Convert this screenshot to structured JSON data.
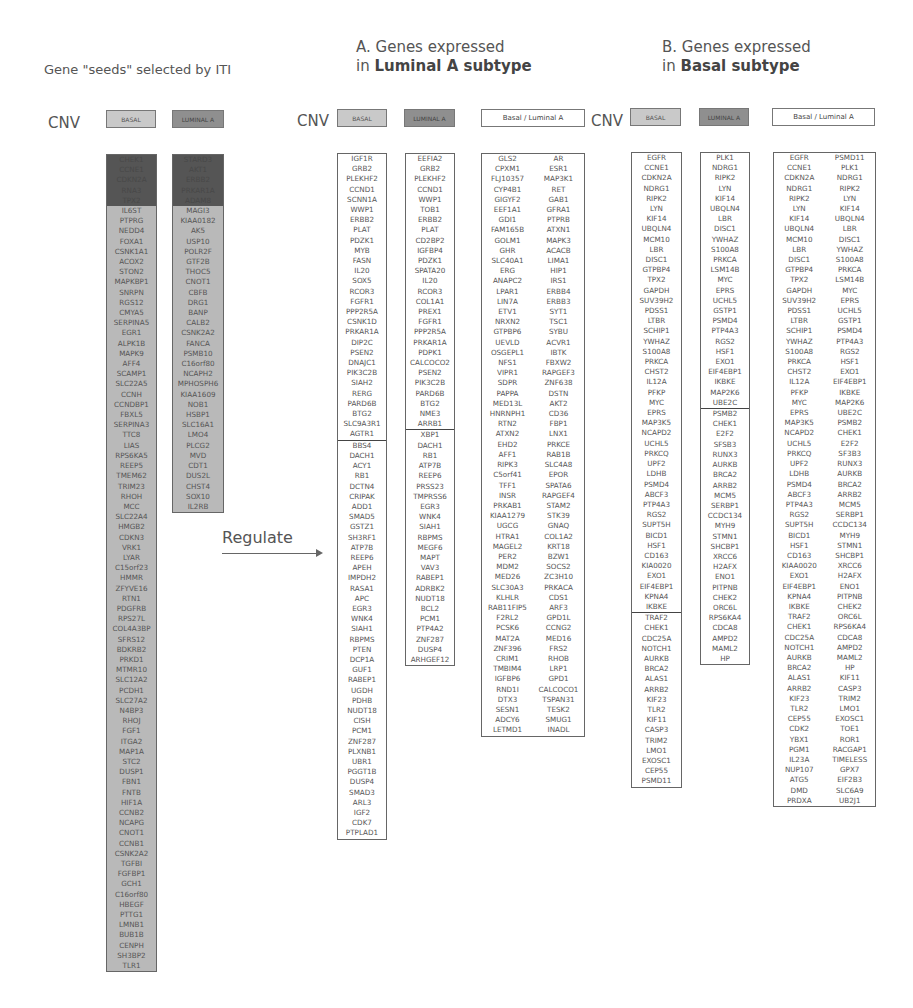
{
  "seeds": {
    "title": "Gene \"seeds\" selected by ITI",
    "cnv_label": "CNV",
    "tag_basal": "BASAL",
    "tag_luminal": "LUMINAL A",
    "basal_hidden": [
      "CHEK1",
      "CCNE1",
      "CDKN2A",
      "RNA3",
      "TPX2"
    ],
    "basal": [
      "IL6ST",
      "PTPRG",
      "NEDD4",
      "FOXA1",
      "CSNK1A1",
      "ACOX2",
      "STON2",
      "MAPKBP1",
      "SNRPN",
      "RGS12",
      "CMYA5",
      "SERPINA5",
      "EGR1",
      "ALPK1B",
      "MAPK9",
      "AFF4",
      "SCAMP1",
      "SLC22A5",
      "CCNH",
      "CCNDBP1",
      "FBXL5",
      "SERPINA3",
      "TTC8",
      "LIAS",
      "RPS6KA5",
      "REEP5",
      "TMEM62",
      "TRIM23",
      "RHOH",
      "MCC",
      "SLC22A4",
      "HMGB2",
      "CDKN3",
      "VRK1",
      "LYAR",
      "C15orf23",
      "HMMR",
      "ZFYVE16",
      "RTN1",
      "PDGFRB",
      "RPS27L",
      "COL4A3BP",
      "SFRS12",
      "BDKRB2",
      "PRKD1",
      "MTMR10",
      "SLC12A2",
      "PCDH1",
      "SLC27A2",
      "N4BP3",
      "RHOJ",
      "FGF1",
      "ITGA2",
      "MAP1A",
      "STC2",
      "DUSP1",
      "FBN1",
      "FNTB",
      "HIF1A",
      "CCNB2",
      "NCAPG",
      "CNOT1",
      "CCNB1",
      "CSNK2A2",
      "TGFBI",
      "FGFBP1",
      "GCH1",
      "C16orf80",
      "HBEGF",
      "PTTG1",
      "LMNB1",
      "BUB1B",
      "CENPH",
      "SH3BP2",
      "TLR1"
    ],
    "luminal_hidden": [
      "STARD3",
      "AKT1",
      "ERBB2",
      "PRKAR1A",
      "ADAM8"
    ],
    "luminal": [
      "MAGI3",
      "KIAA0182",
      "AK5",
      "USP10",
      "POLR2F",
      "GTF2B",
      "THOC5",
      "CNOT1",
      "CBFB",
      "DRG1",
      "BANP",
      "CALB2",
      "CSNK2A2",
      "FANCA",
      "PSMB10",
      "C16orf80",
      "NCAPH2",
      "MPHOSPH6",
      "KIAA1609",
      "NOB1",
      "HSBP1",
      "SLC16A1",
      "LMO4",
      "PLCG2",
      "MVD",
      "CDT1",
      "DUS2L",
      "CHST4",
      "SOX10",
      "IL2RB"
    ]
  },
  "regulate": {
    "label": "Regulate"
  },
  "sectionA": {
    "title_line1": "A. Genes expressed",
    "title_prefix": "in ",
    "title_bold": "Luminal A subtype",
    "cnv_label": "CNV",
    "tag_basal": "BASAL",
    "tag_luminal": "LUMINAL A",
    "tag_both": "Basal / Luminal A",
    "basal_top": [
      "IGF1R",
      "GRB2",
      "PLEKHF2",
      "CCND1",
      "SCNN1A",
      "WWP1",
      "ERBB2",
      "PLAT",
      "PDZK1",
      "MYB",
      "FASN",
      "IL20",
      "SOX5",
      "RCOR3",
      "FGFR1",
      "PPP2R5A",
      "CSNK1D",
      "PRKAR1A",
      "DIP2C",
      "PSEN2",
      "DNAJC1",
      "PIK3C2B",
      "SIAH2",
      "RERG",
      "PARD6B",
      "BTG2",
      "SLC9A3R1",
      "AGTR1"
    ],
    "basal_bottom": [
      "BBS4",
      "DACH1",
      "ACY1",
      "RB1",
      "DCTN4",
      "CRIPAK",
      "ADD1",
      "SMAD5",
      "GSTZ1",
      "SH3RF1",
      "ATP7B",
      "REEP6",
      "APEH",
      "IMPDH2",
      "RASA1",
      "APC",
      "EGR3",
      "WNK4",
      "SIAH1",
      "RBPMS",
      "PTEN",
      "DCP1A",
      "GUF1",
      "RABEP1",
      "UGDH",
      "PDHB",
      "NUDT18",
      "CISH",
      "PCM1",
      "ZNF287",
      "PLXNB1",
      "UBR1",
      "PGGT1B",
      "DUSP4",
      "SMAD3",
      "ARL3",
      "IGF2",
      "CDK7",
      "PTPLAD1"
    ],
    "luminal_top": [
      "EEFIA2",
      "GRB2",
      "PLEKHF2",
      "CCND1",
      "WWP1",
      "TOB1",
      "ERBB2",
      "PLAT",
      "CD2BP2",
      "IGFBP4",
      "PDZK1",
      "SPATA20",
      "IL20",
      "RCOR3",
      "COL1A1",
      "PREX1",
      "FGFR1",
      "PPP2R5A",
      "PRKAR1A",
      "PDPK1",
      "CALCOCO2",
      "PSEN2",
      "PIK3C2B",
      "PARD6B",
      "BTG2",
      "NME3",
      "ARRB1"
    ],
    "luminal_bottom": [
      "XBP1",
      "DACH1",
      "RB1",
      "ATP7B",
      "REEP6",
      "PRSS23",
      "TMPRSS6",
      "EGR3",
      "WNK4",
      "SIAH1",
      "RBPMS",
      "MEGF6",
      "MAPT",
      "VAV3",
      "RABEP1",
      "ADRBK2",
      "NUDT18",
      "BCL2",
      "PCM1",
      "PTP4A2",
      "ZNF287",
      "DUSP4",
      "ARHGEF12"
    ],
    "both_left": [
      "GLS2",
      "CPXM1",
      "FLJ10357",
      "CYP4B1",
      "GIGYF2",
      "EEF1A1",
      "GDI1",
      "FAM165B",
      "GOLM1",
      "GHR",
      "SLC40A1",
      "ERG",
      "ANAPC2",
      "LPAR1",
      "LIN7A",
      "ETV1",
      "NRXN2",
      "GTPBP6",
      "UEVLD",
      "OSGEPL1",
      "NFS1",
      "VIPR1",
      "SDPR",
      "PAPPA",
      "MED13L",
      "HNRNPH1",
      "RTN2",
      "ATXN2",
      "EHD2",
      "AFF1",
      "RIPK3",
      "C5orf41",
      "TFF1",
      "INSR",
      "PRKAB1",
      "KIAA1279",
      "UGCG",
      "HTRA1",
      "MAGEL2",
      "PER2",
      "MDM2",
      "MED26",
      "SLC30A3",
      "KLHLR",
      "RAB11FIP5",
      "F2RL2",
      "PCSK6",
      "MAT2A",
      "ZNF396",
      "CRIM1",
      "TMBIM4",
      "IGFBP6",
      "RND1I",
      "DTX3",
      "SESN1",
      "ADCY6",
      "LETMD1"
    ],
    "both_right": [
      "AR",
      "ESR1",
      "MAP3K1",
      "RET",
      "GAB1",
      "GFRA1",
      "PTPRB",
      "ATXN1",
      "MAPK3",
      "ACACB",
      "LIMA1",
      "HIP1",
      "IRS1",
      "ERBB4",
      "ERBB3",
      "SYT1",
      "TSC1",
      "SYBU",
      "ACVR1",
      "IBTK",
      "FBXW2",
      "RAPGEF3",
      "ZNF638",
      "DSTN",
      "AKT2",
      "CD36",
      "FBP1",
      "LNX1",
      "PRKCE",
      "RAB1B",
      "SLC4A8",
      "EPOR",
      "SPATA6",
      "RAPGEF4",
      "STAM2",
      "STK39",
      "GNAQ",
      "COL1A2",
      "KRT18",
      "BZW1",
      "SOCS2",
      "ZC3H10",
      "PRKACA",
      "CDS1",
      "ARF3",
      "GPD1L",
      "CCNG2",
      "MED16",
      "FRS2",
      "RHOB",
      "LRP1",
      "GPD1",
      "CALCOCO1",
      "TSPAN31",
      "TESK2",
      "SMUG1",
      "INADL"
    ]
  },
  "sectionB": {
    "title_line1": "B. Genes expressed",
    "title_prefix": "in ",
    "title_bold": "Basal subtype",
    "cnv_label": "CNV",
    "tag_basal": "BASAL",
    "tag_luminal": "LUMINAL A",
    "tag_both": "Basal / Luminal A",
    "basal_top": [
      "EGFR",
      "CCNE1",
      "CDKN2A",
      "NDRG1",
      "RIPK2",
      "LYN",
      "KIF14",
      "UBQLN4",
      "MCM10",
      "LBR",
      "DISC1",
      "GTPBP4",
      "TPX2",
      "GAPDH",
      "SUV39H2",
      "PDSS1",
      "LTBR",
      "SCHIP1",
      "YWHAZ",
      "S100A8",
      "PRKCA",
      "CHST2",
      "IL12A",
      "PFKP",
      "MYC",
      "EPRS",
      "MAP3K5",
      "NCAPD2",
      "UCHL5",
      "PRKCQ",
      "UPF2",
      "LDHB",
      "PSMD4",
      "ABCF3",
      "PTP4A3",
      "RGS2",
      "SUPT5H",
      "BICD1",
      "HSF1",
      "CD163",
      "KIA0020",
      "EXO1",
      "EIF4EBP1",
      "KPNA4",
      "IKBKE"
    ],
    "basal_bottom": [
      "TRAF2",
      "CHEK1",
      "CDC25A",
      "NOTCH1",
      "AURKB",
      "BRCA2",
      "ALAS1",
      "ARRB2",
      "KIF23",
      "TLR2",
      "KIF11",
      "CASP3",
      "TRIM2",
      "LMO1",
      "EXOSC1",
      "CEP55",
      "PSMD11"
    ],
    "luminal_top": [
      "PLK1",
      "NDRG1",
      "RIPK2",
      "LYN",
      "KIF14",
      "UBQLN4",
      "LBR",
      "DISC1",
      "YWHAZ",
      "S100A8",
      "PRKCA",
      "LSM14B",
      "MYC",
      "EPRS",
      "UCHL5",
      "GSTP1",
      "PSMD4",
      "PTP4A3",
      "RGS2",
      "HSF1",
      "EXO1",
      "EIF4EBP1",
      "IKBKE",
      "MAP2K6",
      "UBE2C"
    ],
    "luminal_bottom": [
      "PSMB2",
      "CHEK1",
      "E2F2",
      "SFSB3",
      "RUNX3",
      "AURKB",
      "BRCA2",
      "ARRB2",
      "MCM5",
      "SERBP1",
      "CCDC134",
      "MYH9",
      "STMN1",
      "SHCBP1",
      "XRCC6",
      "H2AFX",
      "ENO1",
      "PITPNB",
      "CHEK2",
      "ORC6L",
      "RPS6KA4",
      "CDCA8",
      "AMPD2",
      "MAML2",
      "HP"
    ],
    "both_left": [
      "EGFR",
      "CCNE1",
      "CDKN2A",
      "NDRG1",
      "RIPK2",
      "LYN",
      "KIF14",
      "UBQLN4",
      "MCM10",
      "LBR",
      "DISC1",
      "GTPBP4",
      "TPX2",
      "GAPDH",
      "SUV39H2",
      "PDSS1",
      "LTBR",
      "SCHIP1",
      "YWHAZ",
      "S100A8",
      "PRKCA",
      "CHST2",
      "IL12A",
      "PFKP",
      "MYC",
      "EPRS",
      "MAP3K5",
      "NCAPD2",
      "UCHL5",
      "PRKCQ",
      "UPF2",
      "LDHB",
      "PSMD4",
      "ABCF3",
      "PTP4A3",
      "RGS2",
      "SUPT5H",
      "BICD1",
      "HSF1",
      "CD163",
      "KIAA0020",
      "EXO1",
      "EIF4EBP1",
      "KPNA4",
      "IKBKE",
      "TRAF2",
      "CHEK1",
      "CDC25A",
      "NOTCH1",
      "AURKB",
      "BRCA2",
      "ALAS1",
      "ARRB2",
      "KIF23",
      "TLR2",
      "CEP55",
      "CDK2",
      "YBX1",
      "PGM1",
      "IL23A",
      "NUP107",
      "ATG5",
      "DMD",
      "PRDXA"
    ],
    "both_right": [
      "PSMD11",
      "PLK1",
      "NDRG1",
      "RIPK2",
      "LYN",
      "KIF14",
      "UBQLN4",
      "LBR",
      "DISC1",
      "YWHAZ",
      "S100A8",
      "PRKCA",
      "LSM14B",
      "MYC",
      "EPRS",
      "UCHL5",
      "GSTP1",
      "PSMD4",
      "PTP4A3",
      "RGS2",
      "HSF1",
      "EXO1",
      "EIF4EBP1",
      "IKBKE",
      "MAP2K6",
      "UBE2C",
      "PSMB2",
      "CHEK1",
      "E2F2",
      "SF3B3",
      "RUNX3",
      "AURKB",
      "BRCA2",
      "ARRB2",
      "MCM5",
      "SERBP1",
      "CCDC134",
      "MYH9",
      "STMN1",
      "SHCBP1",
      "XRCC6",
      "H2AFX",
      "ENO1",
      "PITPNB",
      "CHEK2",
      "ORC6L",
      "RPS6KA4",
      "CDCA8",
      "AMPD2",
      "MAML2",
      "HP",
      "KIF11",
      "CASP3",
      "TRIM2",
      "LMO1",
      "EXOSC1",
      "TOE1",
      "ROR1",
      "RACGAP1",
      "TIMELESS",
      "GPX7",
      "EIF2B3",
      "SLC6A9",
      "UB2J1"
    ]
  },
  "colors": {
    "basal_tag": "#c9c9c9",
    "luminal_tag": "#8f8f8f",
    "seed_bg": "#b9b9b9",
    "seed_dark": "#555555",
    "border": "#666666"
  }
}
